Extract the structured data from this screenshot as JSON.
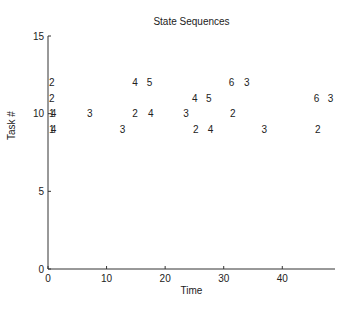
{
  "chart_data": {
    "type": "scatter",
    "title": "State Sequences",
    "xlabel": "Time",
    "ylabel": "Task #",
    "xlim": [
      0,
      49
    ],
    "ylim": [
      0,
      15
    ],
    "xticks": [
      0,
      10,
      20,
      30,
      40
    ],
    "yticks": [
      0,
      5,
      10,
      15
    ],
    "grid": false,
    "legend": null,
    "marker_style": "text labels (state numbers) plotted at (time, task)",
    "series": [
      {
        "name": "Task 12",
        "task": 12,
        "points": [
          {
            "x": 0,
            "label": "2"
          },
          {
            "x": 14.2,
            "label": "4"
          },
          {
            "x": 16.7,
            "label": "5"
          },
          {
            "x": 30.7,
            "label": "6"
          },
          {
            "x": 33.3,
            "label": "3"
          }
        ]
      },
      {
        "name": "Task 11",
        "task": 11,
        "points": [
          {
            "x": 0,
            "label": "2"
          },
          {
            "x": 24.4,
            "label": "4"
          },
          {
            "x": 26.8,
            "label": "5"
          },
          {
            "x": 45.2,
            "label": "6"
          },
          {
            "x": 47.6,
            "label": "3"
          }
        ]
      },
      {
        "name": "Task 10",
        "task": 10,
        "points": [
          {
            "x": 0,
            "label": "1"
          },
          {
            "x": 0.3,
            "label": "4"
          },
          {
            "x": 6.5,
            "label": "3"
          },
          {
            "x": 14.2,
            "label": "2"
          },
          {
            "x": 16.9,
            "label": "4"
          },
          {
            "x": 22.9,
            "label": "3"
          },
          {
            "x": 30.9,
            "label": "2"
          }
        ]
      },
      {
        "name": "Task 9",
        "task": 9,
        "points": [
          {
            "x": 0,
            "label": "1"
          },
          {
            "x": 0.3,
            "label": "4"
          },
          {
            "x": 12.1,
            "label": "3"
          },
          {
            "x": 24.6,
            "label": "2"
          },
          {
            "x": 27.1,
            "label": "4"
          },
          {
            "x": 36.3,
            "label": "3"
          },
          {
            "x": 45.4,
            "label": "2"
          }
        ]
      }
    ]
  },
  "colors": {
    "axis": "#333333",
    "text": "#222222",
    "background": "#ffffff"
  }
}
